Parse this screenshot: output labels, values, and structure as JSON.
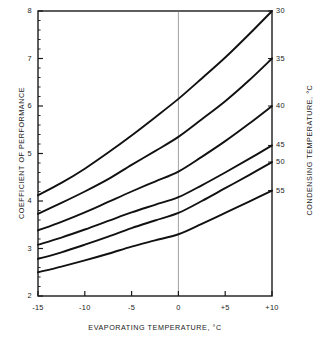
{
  "chart_data": {
    "type": "line",
    "title": "",
    "xlabel": "EVAPORATING TEMPERATURE, °C",
    "ylabel": "COEFFICIENT OF PERFORMANCE",
    "y2label": "CONDENSING TEMPERATURE, °C",
    "xlim": [
      -15,
      10
    ],
    "ylim": [
      2,
      8
    ],
    "xticks": [
      -15,
      -10,
      -5,
      0,
      5,
      10
    ],
    "xticklabels": [
      "-15",
      "-10",
      "-5",
      "0",
      "+5",
      "+10"
    ],
    "yticks": [
      2,
      3,
      4,
      5,
      6,
      7,
      8
    ],
    "yticklabels": [
      "2",
      "3",
      "4",
      "5",
      "6",
      "7",
      "8"
    ],
    "y_minor_tick_step": 0.2,
    "grid": false,
    "legend_position": "right-axis-curve-labels",
    "reference_lines": [
      {
        "orientation": "vertical",
        "value": 0,
        "style": "thin"
      }
    ],
    "x": [
      -15,
      -12.5,
      -10,
      -7.5,
      -5,
      -2.5,
      0,
      2.5,
      5,
      7.5,
      10
    ],
    "series": [
      {
        "name": "30",
        "label": "30",
        "values": [
          4.12,
          4.38,
          4.68,
          5.02,
          5.38,
          5.76,
          6.15,
          6.58,
          7.02,
          7.5,
          8.0
        ]
      },
      {
        "name": "35",
        "label": "35",
        "values": [
          3.73,
          3.96,
          4.2,
          4.46,
          4.76,
          5.05,
          5.35,
          5.72,
          6.1,
          6.53,
          7.0
        ]
      },
      {
        "name": "40",
        "label": "40",
        "values": [
          3.38,
          3.56,
          3.76,
          3.98,
          4.2,
          4.41,
          4.62,
          4.93,
          5.26,
          5.62,
          6.0
        ]
      },
      {
        "name": "45",
        "label": "45",
        "values": [
          3.08,
          3.23,
          3.4,
          3.58,
          3.76,
          3.92,
          4.08,
          4.33,
          4.6,
          4.88,
          5.17
        ]
      },
      {
        "name": "50",
        "label": "50",
        "values": [
          2.78,
          2.92,
          3.08,
          3.25,
          3.43,
          3.59,
          3.75,
          4.0,
          4.27,
          4.54,
          4.82
        ]
      },
      {
        "name": "55",
        "label": "55",
        "values": [
          2.5,
          2.62,
          2.75,
          2.89,
          3.04,
          3.17,
          3.3,
          3.52,
          3.75,
          3.98,
          4.22
        ]
      }
    ],
    "right_axis_labels": [
      "30",
      "35",
      "40",
      "45",
      "50",
      "55"
    ],
    "colors": {
      "line": "#111111",
      "axis": "#1a1a1a",
      "reference_line": "#777777",
      "background": "#ffffff"
    }
  }
}
